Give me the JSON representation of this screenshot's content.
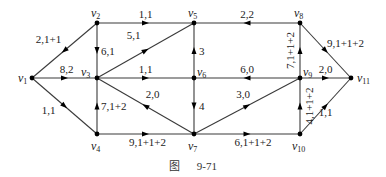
{
  "diagram": {
    "type": "directed-network-flow",
    "caption": {
      "prefix": "图",
      "number": "9-71"
    },
    "nodes": [
      {
        "id": "v1",
        "label": "v",
        "sub": "1",
        "x": 32,
        "y": 78
      },
      {
        "id": "v2",
        "label": "v",
        "sub": "2",
        "x": 97,
        "y": 23
      },
      {
        "id": "v3",
        "label": "v",
        "sub": "3",
        "x": 97,
        "y": 78
      },
      {
        "id": "v4",
        "label": "v",
        "sub": "4",
        "x": 97,
        "y": 134
      },
      {
        "id": "v5",
        "label": "v",
        "sub": "5",
        "x": 194,
        "y": 23
      },
      {
        "id": "v6",
        "label": "v",
        "sub": "6",
        "x": 194,
        "y": 78
      },
      {
        "id": "v7",
        "label": "v",
        "sub": "7",
        "x": 194,
        "y": 134
      },
      {
        "id": "v8",
        "label": "v",
        "sub": "8",
        "x": 300,
        "y": 23
      },
      {
        "id": "v9",
        "label": "v",
        "sub": "9",
        "x": 300,
        "y": 78
      },
      {
        "id": "v10",
        "label": "v",
        "sub": "10",
        "x": 300,
        "y": 134
      },
      {
        "id": "v11",
        "label": "v",
        "sub": "11",
        "x": 351,
        "y": 78
      }
    ],
    "edges": [
      {
        "from": "v2",
        "to": "v1",
        "label": "2,1+1"
      },
      {
        "from": "v1",
        "to": "v3",
        "label": "8,2"
      },
      {
        "from": "v1",
        "to": "v4",
        "label": "1,1"
      },
      {
        "from": "v2",
        "to": "v3",
        "label": "6,1"
      },
      {
        "from": "v2",
        "to": "v5",
        "label": "1,1"
      },
      {
        "from": "v3",
        "to": "v5",
        "label": "5,1"
      },
      {
        "from": "v3",
        "to": "v6",
        "label": "1,1"
      },
      {
        "from": "v7",
        "to": "v3",
        "label": "2,0"
      },
      {
        "from": "v4",
        "to": "v3",
        "label": "7,1+2"
      },
      {
        "from": "v4",
        "to": "v7",
        "label": "9,1+1+2"
      },
      {
        "from": "v6",
        "to": "v5",
        "label": "3"
      },
      {
        "from": "v8",
        "to": "v5",
        "label": "2,2"
      },
      {
        "from": "v9",
        "to": "v6",
        "label": "6,0"
      },
      {
        "from": "v6",
        "to": "v7",
        "label": "4"
      },
      {
        "from": "v7",
        "to": "v9",
        "label": "3,0"
      },
      {
        "from": "v7",
        "to": "v10",
        "label": "6,1+1+2"
      },
      {
        "from": "v9",
        "to": "v8",
        "label": "7,1+1+2"
      },
      {
        "from": "v8",
        "to": "v11",
        "label": "9,1+1+2"
      },
      {
        "from": "v9",
        "to": "v11",
        "label": "2,0"
      },
      {
        "from": "v10",
        "to": "v9",
        "label": "4,1+1+2"
      },
      {
        "from": "v10",
        "to": "v11",
        "label": "1,1"
      }
    ]
  }
}
